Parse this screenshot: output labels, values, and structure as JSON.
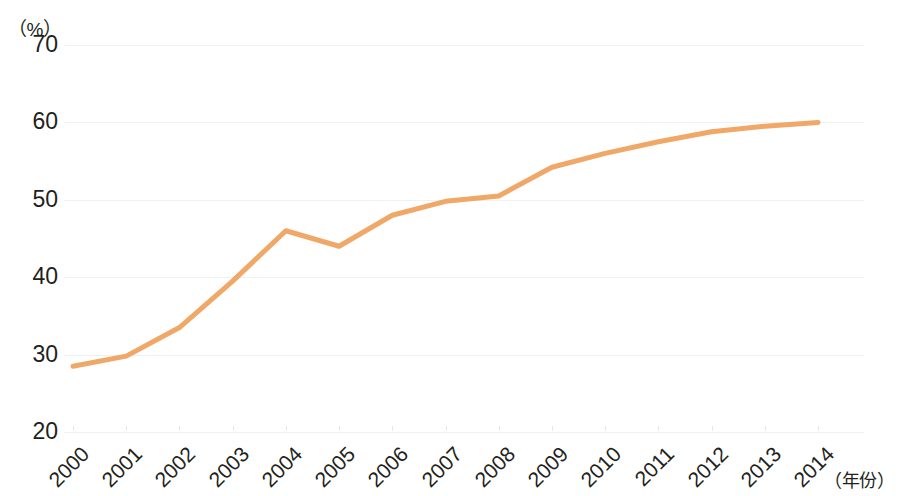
{
  "chart_data": {
    "type": "line",
    "title": "",
    "xlabel": "（年份）",
    "ylabel": "（%）",
    "categories": [
      "2000",
      "2001",
      "2002",
      "2003",
      "2004",
      "2005",
      "2006",
      "2007",
      "2008",
      "2009",
      "2010",
      "2011",
      "2012",
      "2013",
      "2014"
    ],
    "x": [
      2000,
      2001,
      2002,
      2003,
      2004,
      2005,
      2006,
      2007,
      2008,
      2009,
      2010,
      2011,
      2012,
      2013,
      2014
    ],
    "values": [
      28.5,
      29.8,
      33.5,
      39.5,
      46.0,
      44.0,
      48.0,
      49.8,
      50.5,
      54.2,
      56.0,
      57.5,
      58.8,
      59.5,
      60.0
    ],
    "series": [
      {
        "name": "",
        "values": [
          28.5,
          29.8,
          33.5,
          39.5,
          46.0,
          44.0,
          48.0,
          49.8,
          50.5,
          54.2,
          56.0,
          57.5,
          58.8,
          59.5,
          60.0
        ]
      }
    ],
    "ylim": [
      20,
      70
    ],
    "yticks": [
      20,
      30,
      40,
      50,
      60,
      70
    ],
    "ytick_labels": [
      "20",
      "30",
      "40",
      "50",
      "60",
      "70"
    ],
    "grid": true,
    "legend": "none",
    "line_color": "#f0a868",
    "line_width": 5,
    "markers": false,
    "xtick_rotation": -45
  },
  "axes": {
    "y_unit": "（%）",
    "x_unit": "（年份）"
  }
}
